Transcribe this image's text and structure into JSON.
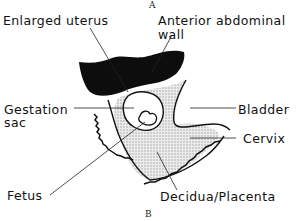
{
  "diagram": {
    "markers": {
      "top": "A",
      "bottom": "B"
    },
    "labels": {
      "enlarged_uterus": "Enlarged uterus",
      "anterior_abdominal_wall_1": "Anterior abdominal",
      "anterior_abdominal_wall_2": "wall",
      "gestation_sac_1": "Gestation",
      "gestation_sac_2": "sac",
      "bladder": "Bladder",
      "cervix": "Cervix",
      "fetus": "Fetus",
      "decidua_placenta": "Decidua/Placenta"
    },
    "colors": {
      "ink": "#111111",
      "stipple": "#d4d4d4",
      "background": "#ffffff"
    }
  }
}
